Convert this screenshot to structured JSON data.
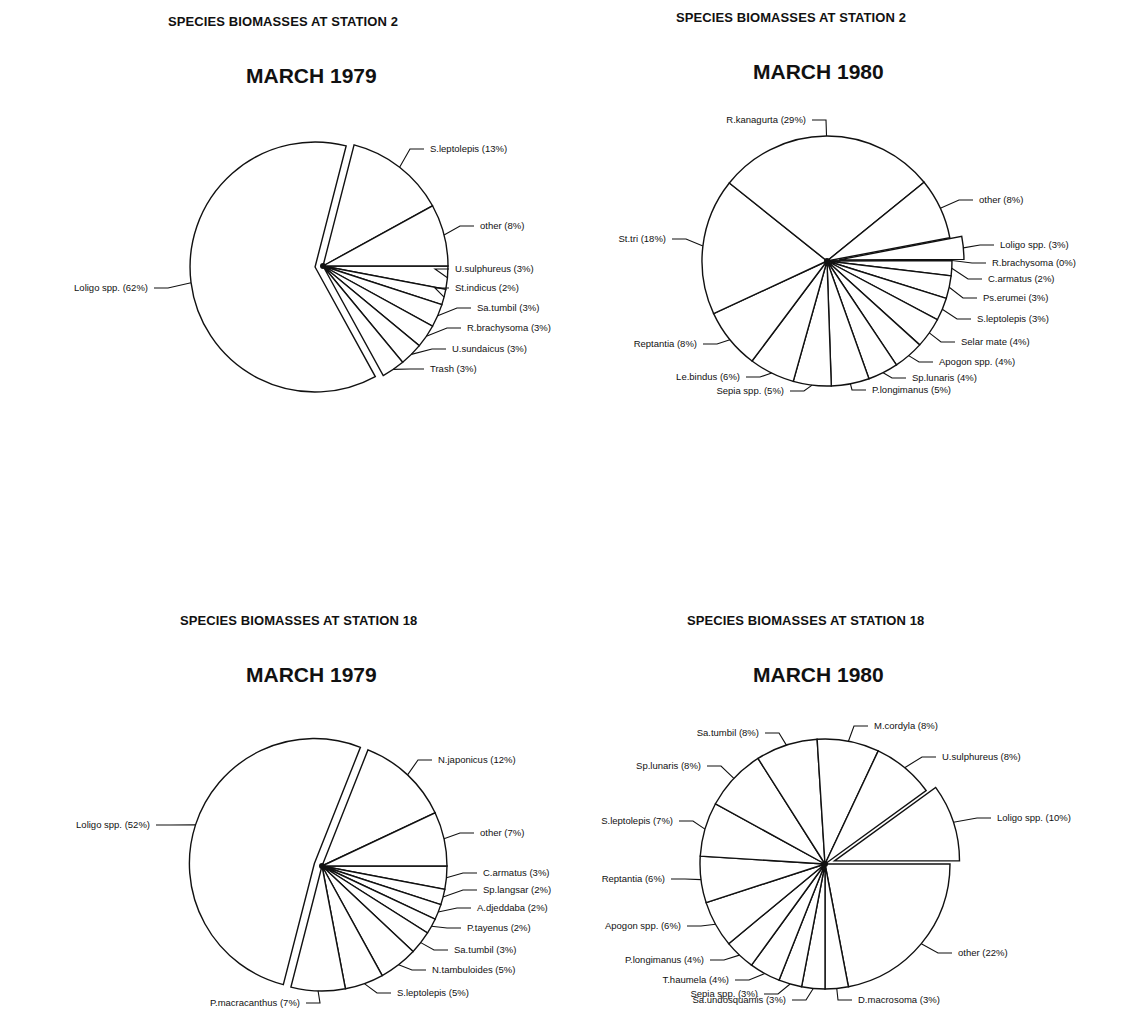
{
  "chart_data": [
    {
      "type": "pie",
      "subtitle": "SPECIES BIOMASSES AT STATION 2",
      "title": "MARCH 1979",
      "center": [
        323,
        266
      ],
      "radius": 125,
      "start_angle_deg": 0,
      "slices": [
        {
          "label": "U.sulphureus (3%)",
          "name": "U.sulphureus",
          "value": 3,
          "label_pos": [
            453,
            272
          ],
          "anchor": "start"
        },
        {
          "label": "St.indicus (2%)",
          "name": "St.indicus",
          "value": 2,
          "label_pos": [
            453,
            291
          ],
          "anchor": "start"
        },
        {
          "label": "Sa.tumbil (3%)",
          "name": "Sa.tumbil",
          "value": 3,
          "label_pos": [
            475,
            311
          ],
          "anchor": "start"
        },
        {
          "label": "R.brachysoma (3%)",
          "name": "R.brachysoma",
          "value": 3,
          "label_pos": [
            465,
            331
          ],
          "anchor": "start"
        },
        {
          "label": "U.sundaicus (3%)",
          "name": "U.sundaicus",
          "value": 3,
          "label_pos": [
            450,
            352
          ],
          "anchor": "start"
        },
        {
          "label": "Trash (3%)",
          "name": "Trash",
          "value": 3,
          "label_pos": [
            428,
            372
          ],
          "anchor": "start"
        },
        {
          "label": "Loligo spp. (62%)",
          "name": "Loligo spp.",
          "value": 62,
          "label_pos": [
            150,
            291
          ],
          "anchor": "end",
          "explode": 8
        },
        {
          "label": "S.leptolepis (13%)",
          "name": "S.leptolepis",
          "value": 13,
          "label_pos": [
            428,
            152
          ],
          "anchor": "start"
        },
        {
          "label": "other (8%)",
          "name": "other",
          "value": 8,
          "label_pos": [
            478,
            229
          ],
          "anchor": "start"
        }
      ]
    },
    {
      "type": "pie",
      "subtitle": "SPECIES BIOMASSES AT STATION 2",
      "title": "MARCH 1980",
      "center": [
        827,
        261
      ],
      "radius": 125,
      "start_angle_deg": -10.8,
      "slices": [
        {
          "label": "Loligo spp. (3%)",
          "name": "Loligo spp.",
          "value": 3,
          "label_pos": [
            998,
            248
          ],
          "anchor": "start",
          "explode": 12
        },
        {
          "label": "R.brachysoma (0%)",
          "name": "R.brachysoma",
          "value": 0,
          "label_pos": [
            990,
            266
          ],
          "anchor": "start"
        },
        {
          "label": "C.armatus (2%)",
          "name": "C.armatus",
          "value": 2,
          "label_pos": [
            986,
            282
          ],
          "anchor": "start"
        },
        {
          "label": "Ps.erumei (3%)",
          "name": "Ps.erumei",
          "value": 3,
          "label_pos": [
            981,
            301
          ],
          "anchor": "start"
        },
        {
          "label": "S.leptolepis (3%)",
          "name": "S.leptolepis",
          "value": 3,
          "label_pos": [
            975,
            322
          ],
          "anchor": "start"
        },
        {
          "label": "Selar mate (4%)",
          "name": "Selar mate",
          "value": 4,
          "label_pos": [
            959,
            345
          ],
          "anchor": "start"
        },
        {
          "label": "Apogon spp. (4%)",
          "name": "Apogon spp.",
          "value": 4,
          "label_pos": [
            937,
            365
          ],
          "anchor": "start"
        },
        {
          "label": "Sp.lunaris (4%)",
          "name": "Sp.lunaris",
          "value": 4,
          "label_pos": [
            910,
            381
          ],
          "anchor": "start"
        },
        {
          "label": "P.longimanus (5%)",
          "name": "P.longimanus",
          "value": 5,
          "label_pos": [
            870,
            393
          ],
          "anchor": "start"
        },
        {
          "label": "Sepia spp. (5%)",
          "name": "Sepia spp.",
          "value": 5,
          "label_pos": [
            786,
            394
          ],
          "anchor": "end"
        },
        {
          "label": "Le.bindus (6%)",
          "name": "Le.bindus",
          "value": 6,
          "label_pos": [
            742,
            380
          ],
          "anchor": "end"
        },
        {
          "label": "Reptantia (8%)",
          "name": "Reptantia",
          "value": 8,
          "label_pos": [
            699,
            347
          ],
          "anchor": "end"
        },
        {
          "label": "St.tri (18%)",
          "name": "St.tri",
          "value": 18,
          "label_pos": [
            668,
            242
          ],
          "anchor": "end"
        },
        {
          "label": "R.kanagurta (29%)",
          "name": "R.kanagurta",
          "value": 29,
          "label_pos": [
            808,
            123
          ],
          "anchor": "end"
        },
        {
          "label": "other (8%)",
          "name": "other",
          "value": 8,
          "label_pos": [
            977,
            203
          ],
          "anchor": "start"
        }
      ]
    },
    {
      "type": "pie",
      "subtitle": "SPECIES BIOMASSES AT STATION 18",
      "title": "MARCH 1979",
      "center": [
        322,
        866
      ],
      "radius": 125,
      "start_angle_deg": 0,
      "slices": [
        {
          "label": "C.armatus (3%)",
          "name": "C.armatus",
          "value": 3,
          "label_pos": [
            481,
            876
          ],
          "anchor": "start"
        },
        {
          "label": "Sp.langsar (2%)",
          "name": "Sp.langsar",
          "value": 2,
          "label_pos": [
            481,
            893
          ],
          "anchor": "start"
        },
        {
          "label": "A.djeddaba (2%)",
          "name": "A.djeddaba",
          "value": 2,
          "label_pos": [
            475,
            911
          ],
          "anchor": "start"
        },
        {
          "label": "P.tayenus (2%)",
          "name": "P.tayenus",
          "value": 2,
          "label_pos": [
            465,
            931
          ],
          "anchor": "start"
        },
        {
          "label": "Sa.tumbil (3%)",
          "name": "Sa.tumbil",
          "value": 3,
          "label_pos": [
            452,
            953
          ],
          "anchor": "start"
        },
        {
          "label": "N.tambuloides (5%)",
          "name": "N.tambuloides",
          "value": 5,
          "label_pos": [
            430,
            973
          ],
          "anchor": "start"
        },
        {
          "label": "S.leptolepis (5%)",
          "name": "S.leptolepis",
          "value": 5,
          "label_pos": [
            395,
            996
          ],
          "anchor": "start"
        },
        {
          "label": "P.macracanthus (7%)",
          "name": "P.macracanthus",
          "value": 7,
          "label_pos": [
            302,
            1006
          ],
          "anchor": "end"
        },
        {
          "label": "Loligo spp. (52%)",
          "name": "Loligo spp.",
          "value": 52,
          "label_pos": [
            152,
            828
          ],
          "anchor": "end",
          "explode": 8
        },
        {
          "label": "N.japonicus (12%)",
          "name": "N.japonicus",
          "value": 12,
          "label_pos": [
            436,
            763
          ],
          "anchor": "start"
        },
        {
          "label": "other (7%)",
          "name": "other",
          "value": 7,
          "label_pos": [
            478,
            836
          ],
          "anchor": "start"
        }
      ]
    },
    {
      "type": "pie",
      "subtitle": "SPECIES BIOMASSES AT STATION 18",
      "title": "MARCH 1980",
      "center": [
        825,
        864
      ],
      "radius": 125,
      "start_angle_deg": 0,
      "slices": [
        {
          "label": "other (22%)",
          "name": "other",
          "value": 22,
          "label_pos": [
            956,
            956
          ],
          "anchor": "start"
        },
        {
          "label": "D.macrosoma (3%)",
          "name": "D.macrosoma",
          "value": 3,
          "label_pos": [
            856,
            1003
          ],
          "anchor": "start"
        },
        {
          "label": "Sa.undosquamis (3%)",
          "name": "Sa.undosquamis",
          "value": 3,
          "label_pos": [
            788,
            1003
          ],
          "anchor": "end"
        },
        {
          "label": "Sepia spp. (3%)",
          "name": "Sepia spp.",
          "value": 3,
          "label_pos": [
            760,
            997
          ],
          "anchor": "end"
        },
        {
          "label": "T.haumela (4%)",
          "name": "T.haumela",
          "value": 4,
          "label_pos": [
            731,
            983
          ],
          "anchor": "end"
        },
        {
          "label": "P.longimanus (4%)",
          "name": "P.longimanus",
          "value": 4,
          "label_pos": [
            706,
            963
          ],
          "anchor": "end"
        },
        {
          "label": "Apogon spp. (6%)",
          "name": "Apogon spp.",
          "value": 6,
          "label_pos": [
            683,
            929
          ],
          "anchor": "end"
        },
        {
          "label": "Reptantia (6%)",
          "name": "Reptantia",
          "value": 6,
          "label_pos": [
            667,
            882
          ],
          "anchor": "end"
        },
        {
          "label": "S.leptolepis (7%)",
          "name": "S.leptolepis",
          "value": 7,
          "label_pos": [
            675,
            824
          ],
          "anchor": "end"
        },
        {
          "label": "Sp.lunaris (8%)",
          "name": "Sp.lunaris",
          "value": 8,
          "label_pos": [
            703,
            769
          ],
          "anchor": "end"
        },
        {
          "label": "Sa.tumbil (8%)",
          "name": "Sa.tumbil",
          "value": 8,
          "label_pos": [
            761,
            736
          ],
          "anchor": "end"
        },
        {
          "label": "M.cordyla (8%)",
          "name": "M.cordyla",
          "value": 8,
          "label_pos": [
            872,
            729
          ],
          "anchor": "start"
        },
        {
          "label": "U.sulphureus (8%)",
          "name": "U.sulphureus",
          "value": 8,
          "label_pos": [
            940,
            760
          ],
          "anchor": "start"
        },
        {
          "label": "Loligo spp. (10%)",
          "name": "Loligo spp.",
          "value": 10,
          "label_pos": [
            995,
            821
          ],
          "anchor": "start",
          "explode": 10
        }
      ]
    }
  ],
  "panels": [
    {
      "subtitle": "SPECIES BIOMASSES AT STATION 2",
      "title": "MARCH 1979"
    },
    {
      "subtitle": "SPECIES BIOMASSES AT STATION 2",
      "title": "MARCH 1980"
    },
    {
      "subtitle": "SPECIES BIOMASSES AT STATION 18",
      "title": "MARCH 1979"
    },
    {
      "subtitle": "SPECIES BIOMASSES AT STATION 18",
      "title": "MARCH 1980"
    }
  ]
}
